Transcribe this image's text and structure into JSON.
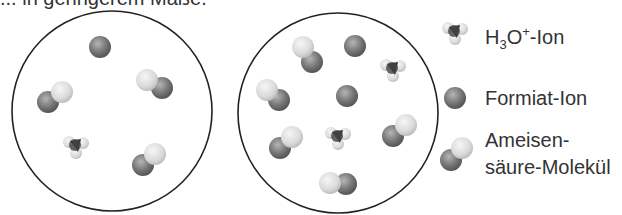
{
  "header": {
    "partial_text": "... in geringerem Maße."
  },
  "legend": {
    "h3o": {
      "prefix": "H",
      "sub": "3",
      "mid": "O",
      "sup": "+",
      "suffix": "-Ion"
    },
    "formiat": {
      "label": "Formiat-Ion"
    },
    "ameisen": {
      "line1": "Ameisen-",
      "line2": "säure-Molekül"
    }
  },
  "colors": {
    "dark_sphere": "#6f6f6f",
    "light_sphere": "#dcdcdc",
    "outline": "#222222",
    "h3o_core": "#333333"
  },
  "beakers": [
    {
      "name": "left-solution",
      "cx": 112,
      "cy": 111,
      "r": 100,
      "formiat": [
        [
          100,
          47
        ]
      ],
      "h3o": [
        [
          76,
          147
        ]
      ],
      "ameisen": [
        [
          [
            62,
            92
          ],
          [
            48,
            102
          ]
        ],
        [
          [
            147,
            80
          ],
          [
            162,
            88
          ]
        ],
        [
          [
            155,
            154
          ],
          [
            143,
            165
          ]
        ]
      ]
    },
    {
      "name": "right-solution",
      "cx": 338,
      "cy": 113,
      "r": 100,
      "formiat": [
        [
          355,
          46
        ],
        [
          347,
          96
        ]
      ],
      "h3o": [
        [
          393,
          70
        ],
        [
          338,
          138
        ]
      ],
      "ameisen": [
        [
          [
            303,
            47
          ],
          [
            312,
            62
          ]
        ],
        [
          [
            267,
            90
          ],
          [
            279,
            100
          ]
        ],
        [
          [
            292,
            137
          ],
          [
            280,
            148
          ]
        ],
        [
          [
            406,
            125
          ],
          [
            393,
            136
          ]
        ],
        [
          [
            330,
            183
          ],
          [
            346,
            184
          ]
        ]
      ]
    }
  ]
}
